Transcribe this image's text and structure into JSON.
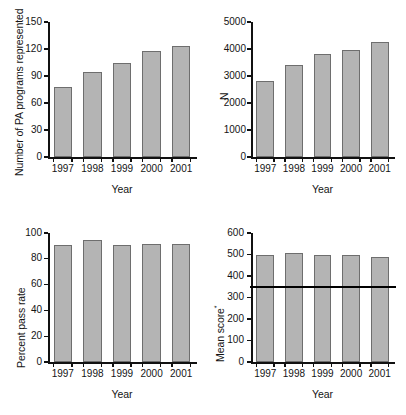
{
  "figure": {
    "title": "",
    "panel_count": 4,
    "bar_fill_color": "#b4b4b4",
    "bar_edge_color": "#6e6e6e",
    "axis_color": "#111111",
    "refline_color": "#000000"
  },
  "chart_data": [
    {
      "id": "panel-programs",
      "type": "bar",
      "title": "",
      "xlabel": "Year",
      "ylabel": "Number of PA programs represented",
      "categories": [
        "1997",
        "1998",
        "1999",
        "2000",
        "2001"
      ],
      "values": [
        78,
        95,
        104,
        118,
        123
      ],
      "ylim": [
        0,
        150
      ],
      "yticks": [
        0,
        30,
        60,
        90,
        120,
        150
      ],
      "ytick_labels": [
        "0",
        "30",
        "60",
        "90",
        "120",
        "150"
      ],
      "grid": false,
      "legend": null
    },
    {
      "id": "panel-n",
      "type": "bar",
      "title": "",
      "xlabel": "Year",
      "ylabel": "N",
      "categories": [
        "1997",
        "1998",
        "1999",
        "2000",
        "2001"
      ],
      "values": [
        2810,
        3400,
        3820,
        3970,
        4270
      ],
      "ylim": [
        0,
        5000
      ],
      "yticks": [
        0,
        1000,
        2000,
        3000,
        4000,
        5000
      ],
      "ytick_labels": [
        "0",
        "1000",
        "2000",
        "3000",
        "4000",
        "5000"
      ],
      "grid": false,
      "legend": null
    },
    {
      "id": "panel-passrate",
      "type": "bar",
      "title": "",
      "xlabel": "Year",
      "ylabel": "Percent pass rate",
      "categories": [
        "1997",
        "1998",
        "1999",
        "2000",
        "2001"
      ],
      "values": [
        91,
        94.5,
        91,
        91.5,
        91.5
      ],
      "ylim": [
        0,
        100
      ],
      "yticks": [
        0,
        20,
        40,
        60,
        80,
        100
      ],
      "ytick_labels": [
        "0",
        "20",
        "40",
        "60",
        "80",
        "100"
      ],
      "grid": false,
      "legend": null
    },
    {
      "id": "panel-meanscore",
      "type": "bar",
      "title": "",
      "xlabel": "Year",
      "ylabel": "Mean score*",
      "ylabel_text": "Mean score",
      "ylabel_superscript": "*",
      "categories": [
        "1997",
        "1998",
        "1999",
        "2000",
        "2001"
      ],
      "values": [
        497,
        508,
        497,
        498,
        490
      ],
      "ylim": [
        0,
        600
      ],
      "yticks": [
        0,
        100,
        200,
        300,
        400,
        500,
        600
      ],
      "ytick_labels": [
        "0",
        "100",
        "200",
        "300",
        "400",
        "500",
        "600"
      ],
      "grid": false,
      "legend": null,
      "annotations": [
        {
          "type": "hline",
          "name": "passing-score-reference-line",
          "value": 348,
          "color": "#000000"
        }
      ]
    }
  ]
}
